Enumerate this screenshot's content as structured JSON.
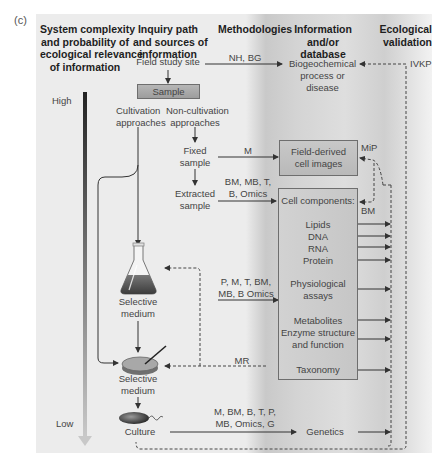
{
  "figure_label": "(c)",
  "headers": {
    "complexity": [
      "System complexity",
      "and probability of",
      "ecological relevance",
      "of information"
    ],
    "inquiry": [
      "Inquiry path",
      "and sources of",
      "information"
    ],
    "methodologies": "Methodologies",
    "information": [
      "Information",
      "and/or",
      "database"
    ],
    "validation": [
      "Ecological",
      "validation"
    ]
  },
  "scale": {
    "high": "High",
    "low": "Low"
  },
  "inquiry_path": {
    "field_study_site": "Field study site",
    "sample": "Sample",
    "cultivation": [
      "Cultivation",
      "approaches"
    ],
    "non_cultivation": [
      "Non-cultivation",
      "approaches"
    ],
    "fixed_sample": [
      "Fixed",
      "sample"
    ],
    "extracted_sample": [
      "Extracted",
      "sample"
    ],
    "selective_medium_flask": [
      "Selective",
      "medium"
    ],
    "selective_medium_plate": [
      "Selective",
      "medium"
    ],
    "culture": "Culture"
  },
  "methods": {
    "field": "NH, BG",
    "fixed": "M",
    "extracted": [
      "BM, MB, T,",
      "B, Omics"
    ],
    "flask": [
      "P, M, T, BM,",
      "MB, B Omics"
    ],
    "plate_feedback": "MR",
    "culture": [
      "M, BM, B, T, P,",
      "MB, Omics, G"
    ]
  },
  "information": {
    "biogeochemical": [
      "Biogeochemical",
      "process or",
      "disease"
    ],
    "field_images": [
      "Field-derived",
      "cell images"
    ],
    "cell_components_title": "Cell components:",
    "cell_components": [
      "Lipids",
      "DNA",
      "RNA",
      "Protein"
    ],
    "physiological": [
      "Physiological",
      "assays"
    ],
    "metabolites": "Metabolites",
    "enzyme": [
      "Enzyme structure",
      "and function"
    ],
    "taxonomy": "Taxonomy",
    "genetics": "Genetics"
  },
  "validation": {
    "ivkp": "IVKP",
    "mip": "MiP",
    "bm": "BM"
  },
  "colors": {
    "panel_bg": "#ececec",
    "dark_band": "#c9c9c9",
    "line": "#3a3a3a",
    "box_border": "#6e6e6e"
  }
}
